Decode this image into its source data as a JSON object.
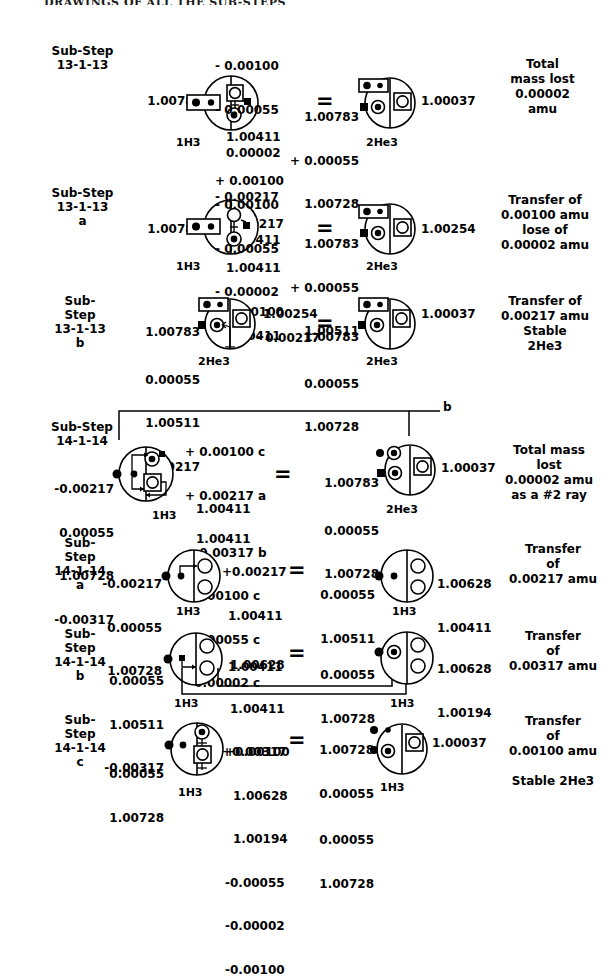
{
  "page": {
    "header": "DRAWINGS OF ALL THE SUB-STEPS"
  },
  "sections": [
    {
      "id": "13-1-13",
      "step_label": "Sub-Step\n13-1-13",
      "left_value": "1.00783",
      "top_stack": [
        "- 0.00100",
        "- 0.00055",
        "0.00002",
        "- 0.00217",
        "1.00411"
      ],
      "mid_stack": [
        "1.00411",
        "+ 0.00100",
        "+ 0.00217"
      ],
      "left_isotope": "1H3",
      "equals": "=",
      "right_in_stack": [
        "1.00783",
        "+ 0.00055",
        "1.00728"
      ],
      "right_value": "1.00037",
      "right_isotope": "2He3",
      "result": "Total\nmass lost\n0.00002\namu"
    },
    {
      "id": "13-1-13-a",
      "step_label": "Sub-Step\n13-1-13\na",
      "left_value": "1.00783",
      "top_stack": [
        "- 0.00100",
        "- 0.00055",
        "- 0.00002",
        "1.00411"
      ],
      "mid_stack": [
        "1.00411",
        "+ 0.00100"
      ],
      "left_isotope": "1H3",
      "equals": "=",
      "right_in_stack": [
        "1.00783",
        "+ 0.00055",
        "1.00511"
      ],
      "right_value": "1.00254",
      "right_isotope": "2He3",
      "result": "Transfer of\n0.00100 amu\nlose of\n0.00002 amu"
    },
    {
      "id": "13-1-13-b",
      "step_label": "Sub-\nStep\n13-1-13\nb",
      "left_in_stack": [
        "1.00783",
        "0.00055",
        "1.00511",
        "+ 0.00217"
      ],
      "left_out_top": "1.00254",
      "left_out_bottom": "- 0.00217",
      "left_isotope": "2He3",
      "equals": "=",
      "right_in_stack": [
        "1.00783",
        "0.00055",
        "1.00728"
      ],
      "right_value": "1.00037",
      "right_isotope": "2He3",
      "result": "Transfer of\n0.00217 amu\nStable\n2He3"
    },
    {
      "id": "14-1-14",
      "step_label": "Sub-Step\n14-1-14",
      "branch_label": "b",
      "left_in_stack": [
        "-0.00217",
        "0.00055",
        "1.00728",
        "-0.00317"
      ],
      "top_stack": [
        "+ 0.00100 c",
        "+ 0.00217 a",
        "1.00411"
      ],
      "mid_stack": [
        "1.00411",
        "+ 0.00317 b",
        "- 0.00100 c",
        "- 0.00055 c",
        "- 0.00002 c"
      ],
      "left_isotope": "1H3",
      "equals": "=",
      "right_in_stack": [
        "1.00783",
        "0.00055",
        "1.00728"
      ],
      "right_value": "1.00037",
      "right_isotope": "2He3",
      "result": "Total mass\nlost\n0.00002 amu\nas a #2 ray"
    },
    {
      "id": "14-1-14-a",
      "step_label": "Sub-\nStep\n14-1-14\na",
      "left_in_stack": [
        "-0.00217",
        "0.00055",
        "1.00728"
      ],
      "out_stack": [
        "+0.00217",
        "1.00411",
        "1.00411"
      ],
      "left_isotope": "1H3",
      "equals": "=",
      "right_in_stack": [
        "0.00055",
        "1.00511"
      ],
      "right_out_stack": [
        "1.00628",
        "1.00411"
      ],
      "right_isotope": "1H3",
      "result": "Transfer\nof\n0.00217 amu"
    },
    {
      "id": "14-1-14-b",
      "step_label": "Sub-\nStep\n14-1-14\nb",
      "left_in_stack": [
        "0.00055",
        "1.00511",
        "-0.00317"
      ],
      "out_stack": [
        "1.00628",
        "1.00411",
        "+0.00317"
      ],
      "left_isotope": "1H3",
      "equals": "=",
      "right_in_stack": [
        "0.00055",
        "1.00728"
      ],
      "right_out_stack": [
        "1.00628",
        "1.00194"
      ],
      "right_isotope": "1H3",
      "result": "Transfer\nof\n0.00317 amu"
    },
    {
      "id": "14-1-14-c",
      "step_label": "Sub-\nStep\n14-1-14\nc",
      "left_in_stack": [
        "0.00055",
        "1.00728"
      ],
      "out_stack": [
        "+0.00100",
        "1.00628",
        "1.00194",
        "-0.00055",
        "-0.00002",
        "-0.00100"
      ],
      "left_isotope": "1H3",
      "equals": "=",
      "right_in_stack": [
        "1.00728",
        "0.00055",
        "0.00055",
        "1.00728"
      ],
      "right_value": "1.00037",
      "right_isotope": "1H3",
      "result": "Transfer\nof\n0.00100 amu\n\nStable 2He3"
    }
  ]
}
